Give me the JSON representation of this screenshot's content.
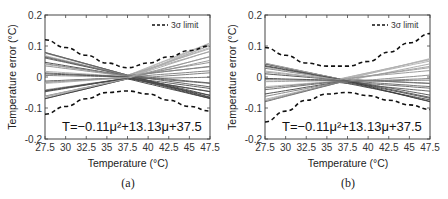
{
  "chart_data": [
    {
      "id": "a",
      "type": "line",
      "caption": "(a)",
      "xlabel": "Temperature (°C)",
      "ylabel": "Temperature error (°C)",
      "xlim": [
        27.5,
        47.5
      ],
      "ylim": [
        -0.2,
        0.2
      ],
      "xticks": [
        "27.5",
        "30",
        "32.5",
        "35",
        "37.5",
        "40",
        "42.5",
        "45",
        "47.5"
      ],
      "yticks": [
        "0.2",
        "0.1",
        "0",
        "-0.1",
        "-0.2"
      ],
      "legend": {
        "entries": [
          "3σ limit"
        ],
        "position": "upper right"
      },
      "annotation": "T=-0.11μ²+13.13μ+37.5",
      "x": [
        27.5,
        30,
        32.5,
        35,
        37.5,
        40,
        42.5,
        45,
        47.5
      ],
      "series": [
        {
          "name": "3σ upper limit",
          "style": "dashed",
          "values": [
            0.12,
            0.095,
            0.07,
            0.045,
            0.03,
            0.045,
            0.065,
            0.085,
            0.1
          ]
        },
        {
          "name": "3σ lower limit",
          "style": "dashed",
          "values": [
            -0.12,
            -0.095,
            -0.07,
            -0.05,
            -0.045,
            -0.055,
            -0.075,
            -0.095,
            -0.11
          ]
        },
        {
          "name": "sensor curves (range)",
          "style": "solid",
          "envelope_upper": [
            0.08,
            0.06,
            0.04,
            0.02,
            0.01,
            0.035,
            0.06,
            0.085,
            0.11
          ],
          "envelope_lower": [
            -0.07,
            -0.05,
            -0.035,
            -0.02,
            -0.01,
            -0.025,
            -0.04,
            -0.055,
            -0.07
          ]
        }
      ]
    },
    {
      "id": "b",
      "type": "line",
      "caption": "(b)",
      "xlabel": "Temperature (°C)",
      "ylabel": "Temperature error (°C)",
      "xlim": [
        27.5,
        47.5
      ],
      "ylim": [
        -0.2,
        0.2
      ],
      "xticks": [
        "27.5",
        "30",
        "32.5",
        "35",
        "37.5",
        "40",
        "42.5",
        "45",
        "47.5"
      ],
      "yticks": [
        "0.2",
        "0.1",
        "0",
        "-0.1",
        "-0.2"
      ],
      "legend": {
        "entries": [
          "3σ limit"
        ],
        "position": "upper right"
      },
      "annotation": "T=-0.11μ²+13.13μ+37.5",
      "x": [
        27.5,
        30,
        32.5,
        35,
        37.5,
        40,
        42.5,
        45,
        47.5
      ],
      "series": [
        {
          "name": "3σ upper limit",
          "style": "dashed",
          "values": [
            0.095,
            0.07,
            0.045,
            0.035,
            0.035,
            0.05,
            0.08,
            0.11,
            0.14
          ]
        },
        {
          "name": "3σ lower limit",
          "style": "dashed",
          "values": [
            -0.145,
            -0.11,
            -0.075,
            -0.055,
            -0.05,
            -0.06,
            -0.075,
            -0.09,
            -0.105
          ]
        },
        {
          "name": "sensor curves (range)",
          "style": "solid",
          "envelope_upper": [
            0.045,
            0.03,
            0.015,
            0.005,
            0.0,
            0.02,
            0.035,
            0.05,
            0.06
          ],
          "envelope_lower": [
            -0.08,
            -0.06,
            -0.04,
            -0.025,
            -0.02,
            -0.035,
            -0.05,
            -0.065,
            -0.08
          ]
        }
      ]
    }
  ],
  "labels": {
    "a": {
      "caption": "(a)",
      "xlabel": "Temperature (°C)",
      "ylabel": "Temperature error (°C)",
      "legend": "3σ limit",
      "equation": "T=−0.11μ²+13.13μ+37.5"
    },
    "b": {
      "caption": "(b)",
      "xlabel": "Temperature (°C)",
      "ylabel": "Temperature error (°C)",
      "legend": "3σ limit",
      "equation": "T=−0.11μ²+13.13μ+37.5"
    }
  }
}
